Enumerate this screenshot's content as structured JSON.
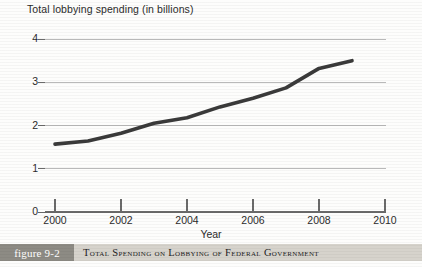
{
  "chart_data": {
    "type": "line",
    "title": "Total lobbying spending (in billions)",
    "xlabel": "Year",
    "ylabel": "",
    "x": [
      2000,
      2001,
      2002,
      2003,
      2004,
      2005,
      2006,
      2007,
      2008,
      2009
    ],
    "values": [
      1.57,
      1.64,
      1.82,
      2.05,
      2.18,
      2.43,
      2.63,
      2.87,
      3.32,
      3.5
    ],
    "series": [
      {
        "name": "Total lobbying spending",
        "values": [
          1.57,
          1.64,
          1.82,
          2.05,
          2.18,
          2.43,
          2.63,
          2.87,
          3.32,
          3.5
        ]
      }
    ],
    "xlim": [
      2000,
      2010
    ],
    "ylim": [
      0,
      4
    ],
    "xticks": [
      2000,
      2002,
      2004,
      2006,
      2008,
      2010
    ],
    "xtick_labels": [
      "2000",
      "2002",
      "2004",
      "2006",
      "2008",
      "2010"
    ],
    "yticks": [
      0,
      1,
      2,
      3,
      4
    ],
    "ytick_labels": [
      "0",
      "1",
      "2",
      "3",
      "4"
    ],
    "grid": "horizontal",
    "legend": "none",
    "line_color": "#3a3a3a"
  },
  "caption": {
    "tag": "figure 9-2",
    "text": "Total Spending on Lobbying of Federal Government"
  },
  "colors": {
    "line": "#3a3a3a",
    "grid": "#b9b9b9",
    "axis": "#6a6a6a",
    "caption_bar": "#d6d3cc",
    "caption_tag": "#8d8b84"
  }
}
